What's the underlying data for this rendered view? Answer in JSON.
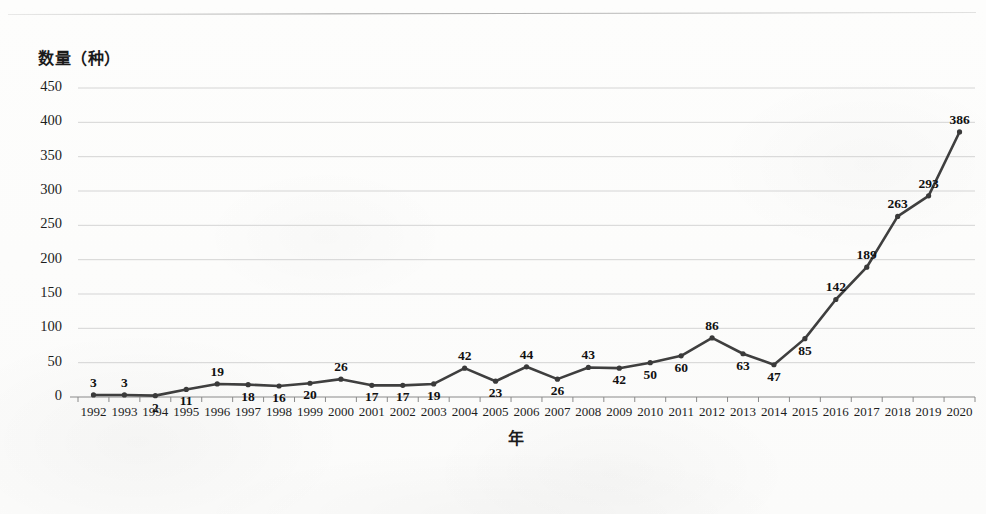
{
  "chart_data": {
    "type": "line",
    "title": "",
    "xlabel": "年",
    "ylabel": "数量（种）",
    "categories": [
      "1992",
      "1993",
      "1994",
      "1995",
      "1996",
      "1997",
      "1998",
      "1999",
      "2000",
      "2001",
      "2002",
      "2003",
      "2004",
      "2005",
      "2006",
      "2007",
      "2008",
      "2009",
      "2010",
      "2011",
      "2012",
      "2013",
      "2014",
      "2015",
      "2016",
      "2017",
      "2018",
      "2019",
      "2020"
    ],
    "values": [
      3,
      3,
      2,
      11,
      19,
      18,
      16,
      20,
      26,
      17,
      17,
      19,
      42,
      23,
      44,
      26,
      43,
      42,
      50,
      60,
      86,
      63,
      47,
      85,
      142,
      189,
      263,
      293,
      386
    ],
    "series": [
      {
        "name": "数量（种）",
        "values": [
          3,
          3,
          2,
          11,
          19,
          18,
          16,
          20,
          26,
          17,
          17,
          19,
          42,
          23,
          44,
          26,
          43,
          42,
          50,
          60,
          86,
          63,
          47,
          85,
          142,
          189,
          263,
          293,
          386
        ]
      }
    ],
    "data_labels": [
      "3",
      "3",
      "2",
      "11",
      "19",
      "18",
      "16",
      "20",
      "26",
      "17",
      "17",
      "19",
      "42",
      "23",
      "44",
      "26",
      "43",
      "42",
      "50",
      "60",
      "86",
      "63",
      "47",
      "85",
      "142",
      "189",
      "263",
      "293",
      "386"
    ],
    "ylim": [
      0,
      450
    ],
    "ytick_values": [
      0,
      50,
      100,
      150,
      200,
      250,
      300,
      350,
      400,
      450
    ],
    "ytick_labels": [
      "0",
      "50",
      "100",
      "150",
      "200",
      "250",
      "300",
      "350",
      "400",
      "450"
    ],
    "grid": true,
    "grid_axis": "y",
    "legend": false,
    "legend_position": "none",
    "line_color": "#3f3f3f",
    "marker": "circle",
    "marker_color": "#3a3a3a",
    "label_color": "#111111",
    "grid_color": "#c9c9c9",
    "axis_color": "#8a8a8a",
    "background_color": "#fdfdfc"
  }
}
